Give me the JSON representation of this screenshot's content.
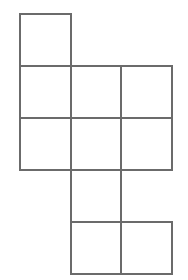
{
  "figure": {
    "name": "cube-net",
    "canvas": {
      "width": 188,
      "height": 280
    },
    "background_color": "#ffffff",
    "stroke_color": "#6b6b6b",
    "stroke_width": 2,
    "cell_width": 50.5,
    "cell_height": 52,
    "origin_x": 20,
    "origin_y": 14,
    "column_lines": [
      20,
      70.5,
      121,
      171.5
    ],
    "row_lines": [
      14,
      66,
      118,
      170,
      222,
      274
    ],
    "column_count": 3,
    "row_count": 5,
    "square_count": 10,
    "squares": [
      {
        "id": "square-r0c0",
        "col": 0,
        "row": 0,
        "x": 20,
        "y": 14,
        "w": 50.5,
        "h": 52
      },
      {
        "id": "square-r1c0",
        "col": 0,
        "row": 1,
        "x": 20,
        "y": 66,
        "w": 50.5,
        "h": 52
      },
      {
        "id": "square-r1c1",
        "col": 1,
        "row": 1,
        "x": 70.5,
        "y": 66,
        "w": 50.5,
        "h": 52
      },
      {
        "id": "square-r1c2",
        "col": 2,
        "row": 1,
        "x": 121,
        "y": 66,
        "w": 50.5,
        "h": 52
      },
      {
        "id": "square-r2c0",
        "col": 0,
        "row": 2,
        "x": 20,
        "y": 118,
        "w": 50.5,
        "h": 52
      },
      {
        "id": "square-r2c1",
        "col": 1,
        "row": 2,
        "x": 70.5,
        "y": 118,
        "w": 50.5,
        "h": 52
      },
      {
        "id": "square-r2c2",
        "col": 2,
        "row": 2,
        "x": 121,
        "y": 118,
        "w": 50.5,
        "h": 52
      },
      {
        "id": "square-r3c1",
        "col": 1,
        "row": 3,
        "x": 70.5,
        "y": 170,
        "w": 50.5,
        "h": 52
      },
      {
        "id": "square-r4c1",
        "col": 1,
        "row": 4,
        "x": 70.5,
        "y": 222,
        "w": 50.5,
        "h": 52
      },
      {
        "id": "square-r4c2",
        "col": 2,
        "row": 4,
        "x": 121,
        "y": 222,
        "w": 50.5,
        "h": 52
      }
    ]
  }
}
